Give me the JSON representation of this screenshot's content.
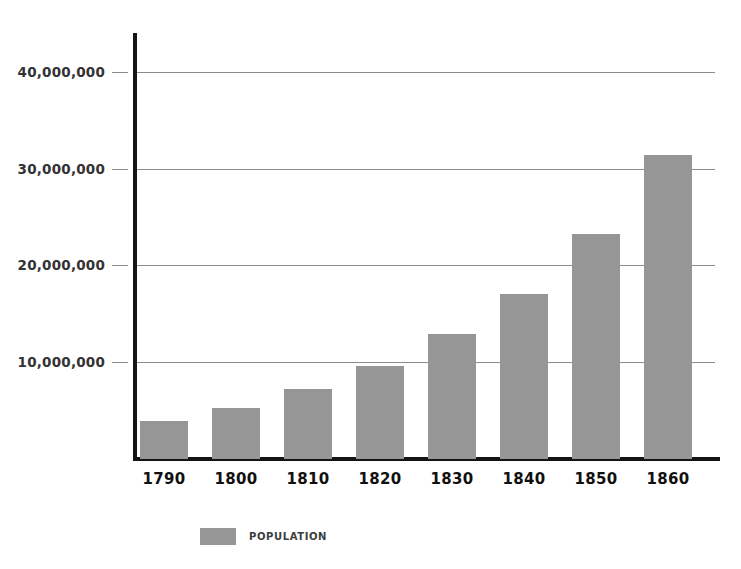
{
  "chart_data": {
    "type": "bar",
    "title": "",
    "subtitle": "",
    "xlabel": "",
    "ylabel": "",
    "categories": [
      "1790",
      "1800",
      "1810",
      "1820",
      "1830",
      "1840",
      "1850",
      "1860"
    ],
    "values": [
      3929214,
      5308483,
      7239881,
      9638453,
      12866020,
      17069453,
      23191876,
      31443321
    ],
    "series": [
      {
        "name": "POPULATION",
        "color": "#969696",
        "values": [
          3929214,
          5308483,
          7239881,
          9638453,
          12866020,
          17069453,
          23191876,
          31443321
        ]
      }
    ],
    "ylim": [
      0,
      44000000
    ],
    "ytick_values": [
      10000000,
      20000000,
      30000000,
      40000000
    ],
    "ytick_labels": [
      "10,000,000",
      "20,000,000",
      "30,000,000",
      "40,000,000"
    ],
    "xtick_labels": [
      "1790",
      "1800",
      "1810",
      "1820",
      "1830",
      "1840",
      "1850",
      "1860"
    ],
    "grid": true,
    "grid_axis": "y",
    "legend": {
      "position": "bottom-left",
      "entries": [
        {
          "label": "POPULATION",
          "color": "#969696"
        }
      ]
    },
    "annotations": []
  },
  "style": {
    "bar_color": "#969696",
    "axis_color": "#141414",
    "grid_color": "#8c8c8c",
    "background": "#ffffff",
    "tick_label_color": "#333333",
    "category_label_color": "#101010",
    "legend_label_color": "#3d3d3d"
  }
}
